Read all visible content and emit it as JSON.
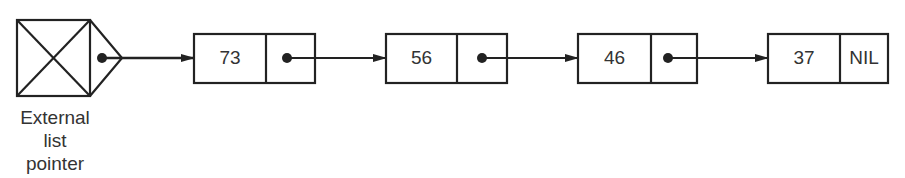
{
  "diagram": {
    "type": "singly-linked-list",
    "external_pointer": {
      "label_lines": [
        "External",
        "list",
        "pointer"
      ]
    },
    "nodes": [
      {
        "info": "73",
        "next": "pointer"
      },
      {
        "info": "56",
        "next": "pointer"
      },
      {
        "info": "46",
        "next": "pointer"
      },
      {
        "info": "37",
        "next": "NIL"
      }
    ],
    "colors": {
      "stroke": "#222222",
      "background": "#ffffff",
      "text": "#333333"
    }
  }
}
